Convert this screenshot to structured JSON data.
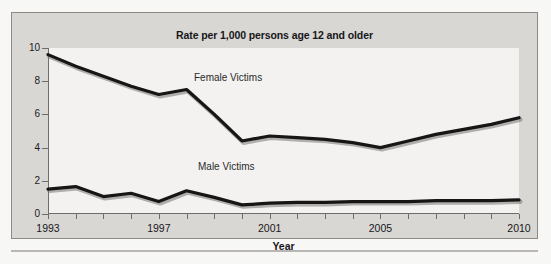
{
  "figure": {
    "title": "Rate per 1,000 persons age 12 and older",
    "xaxis_title": "Year",
    "series_labels": {
      "female": "Female Victims",
      "male": "Male Victims"
    }
  },
  "colors": {
    "line": "#161616",
    "panel": "#f3f2f0",
    "figure_background": "#d9d7d3",
    "axis": "#6f6d6a",
    "text": "#17161a"
  },
  "chart_data": {
    "type": "line",
    "title": "Rate per 1,000 persons age 12 and older",
    "xlabel": "Year",
    "ylabel": "",
    "xlim": [
      1993,
      2010
    ],
    "ylim": [
      0,
      10
    ],
    "yticks": [
      0,
      2,
      4,
      6,
      8,
      10
    ],
    "ytick_labels": [
      "0",
      "2",
      "4",
      "6",
      "8",
      "10"
    ],
    "x": [
      1993,
      1994,
      1995,
      1996,
      1997,
      1998,
      1999,
      2000,
      2001,
      2002,
      2003,
      2004,
      2005,
      2006,
      2007,
      2008,
      2009,
      2010
    ],
    "xticks": [
      1993,
      1994,
      1995,
      1996,
      1997,
      1998,
      1999,
      2000,
      2001,
      2002,
      2003,
      2004,
      2005,
      2006,
      2007,
      2008,
      2009,
      2010
    ],
    "xtick_labels": [
      "1993",
      "",
      "",
      "",
      "1997",
      "",
      "",
      "",
      "2001",
      "",
      "",
      "",
      "2005",
      "",
      "",
      "",
      "",
      "2010"
    ],
    "grid": false,
    "legend": "inline-labels",
    "series": [
      {
        "name": "Female Victims",
        "values": [
          9.6,
          8.9,
          8.3,
          7.7,
          7.2,
          7.5,
          6.0,
          4.4,
          4.7,
          4.6,
          4.5,
          4.3,
          4.0,
          4.4,
          4.8,
          5.1,
          5.4,
          5.8
        ]
      },
      {
        "name": "Male Victims",
        "values": [
          1.5,
          1.65,
          1.05,
          1.25,
          0.75,
          1.4,
          1.0,
          0.55,
          0.65,
          0.7,
          0.7,
          0.75,
          0.75,
          0.75,
          0.8,
          0.8,
          0.8,
          0.85
        ]
      }
    ]
  }
}
